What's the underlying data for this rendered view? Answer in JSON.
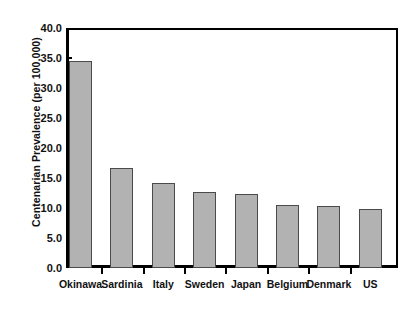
{
  "chart_data": {
    "type": "bar",
    "title": "",
    "xlabel": "",
    "ylabel": "Centenarian Prevalence (per 100,000)",
    "categories": [
      "Okinawa",
      "Sardinia",
      "Italy",
      "Sweden",
      "Japan",
      "Belgium",
      "Denmark",
      "US"
    ],
    "values": [
      34.5,
      16.6,
      14.1,
      12.7,
      12.3,
      10.5,
      10.3,
      9.9
    ],
    "ylim": [
      0.0,
      40.0
    ],
    "ytick_labels": [
      "40.0",
      "35.0",
      "30.0",
      "25.0",
      "20.0",
      "15.0",
      "10.0",
      "5.0",
      "0.0"
    ],
    "ytick_values": [
      40.0,
      35.0,
      30.0,
      25.0,
      20.0,
      15.0,
      10.0,
      5.0,
      0.0
    ],
    "grid": false,
    "legend": "none",
    "bar_color": "#b2b2b2",
    "bar_border_color": "#4a4a4a",
    "axis_color": "#000000"
  }
}
